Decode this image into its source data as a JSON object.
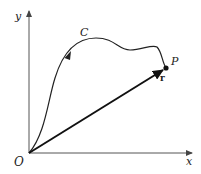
{
  "diagram": {
    "type": "position-vector-on-curve",
    "labels": {
      "origin": "O",
      "x_axis": "x",
      "y_axis": "y",
      "curve": "C",
      "point": "P",
      "vector": "r"
    },
    "colors": {
      "axes": "#555555",
      "curve": "#222222",
      "vector": "#111111",
      "background": "#ffffff"
    }
  }
}
